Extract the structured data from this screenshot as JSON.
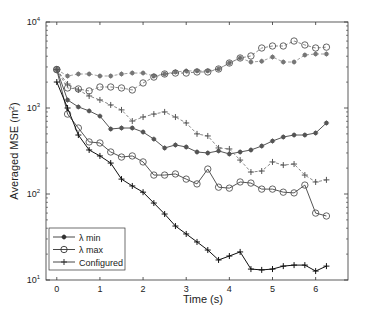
{
  "chart_data": {
    "type": "line",
    "title": "",
    "xlabel": "Time (s)",
    "ylabel": "Averaged MSE (m²)",
    "ylabel_base": "Averaged MSE (m",
    "ylabel_sup": "2",
    "ylabel_tail": ")",
    "yscale": "log",
    "xlim": [
      -0.25,
      6.75
    ],
    "ylim": [
      10,
      10000
    ],
    "xticks": [
      0,
      1,
      2,
      3,
      4,
      5,
      6
    ],
    "xtick_labels": [
      "0",
      "1",
      "2",
      "3",
      "4",
      "5",
      "6"
    ],
    "yticks": [
      10,
      100,
      1000,
      10000
    ],
    "ytick_labels": [
      {
        "base": "10",
        "exp": "1"
      },
      {
        "base": "10",
        "exp": "2"
      },
      {
        "base": "10",
        "exp": "3"
      },
      {
        "base": "10",
        "exp": "4"
      }
    ],
    "grid": false,
    "legend_position": "lower left",
    "x": [
      0,
      0.25,
      0.5,
      0.75,
      1.0,
      1.25,
      1.5,
      1.75,
      2.0,
      2.25,
      2.5,
      2.75,
      3.0,
      3.25,
      3.5,
      3.75,
      4.0,
      4.25,
      4.5,
      4.75,
      5.0,
      5.25,
      5.5,
      5.75,
      6.0,
      6.25
    ],
    "series": [
      {
        "name": "λ min",
        "legend": true,
        "style": "solid",
        "marker": "asterisk-dot",
        "color": "#555555",
        "values": [
          2800,
          1240,
          1030,
          925,
          805,
          570,
          585,
          585,
          525,
          435,
          343,
          372,
          352,
          308,
          300,
          317,
          292,
          308,
          325,
          361,
          413,
          460,
          485,
          485,
          512,
          670
        ]
      },
      {
        "name": "λ max",
        "legend": true,
        "style": "solid",
        "marker": "circle",
        "color": "#555555",
        "values": [
          2800,
          850,
          585,
          403,
          392,
          308,
          269,
          277,
          236,
          166,
          166,
          171,
          149,
          131,
          195,
          120,
          117,
          138,
          134,
          114,
          114,
          105,
          103,
          127,
          60,
          55.5
        ]
      },
      {
        "name": "Configured",
        "legend": true,
        "style": "solid",
        "marker": "plus",
        "color": "#111111",
        "values": [
          2005,
          1000,
          485,
          325,
          277,
          229,
          149,
          124,
          105,
          78.5,
          58.5,
          42.4,
          34.3,
          27.7,
          22.3,
          17.1,
          19.0,
          21.2,
          13.4,
          13.1,
          13.4,
          14.5,
          14.9,
          14.9,
          12.7,
          14.5
        ]
      },
      {
        "name": "λ min (dashed)",
        "legend": false,
        "style": "dashed",
        "marker": "asterisk-dot",
        "color": "#777777",
        "values": [
          2800,
          2355,
          2485,
          2485,
          2355,
          2355,
          2485,
          2550,
          2550,
          2355,
          2485,
          2625,
          2700,
          2700,
          2700,
          2840,
          3335,
          3815,
          3425,
          3500,
          3920,
          3425,
          3425,
          4130,
          4245,
          4245
        ]
      },
      {
        "name": "λ max (dashed)",
        "legend": false,
        "style": "dashed",
        "marker": "circle",
        "color": "#555555",
        "values": [
          2800,
          1710,
          1665,
          1580,
          1755,
          1755,
          1710,
          1620,
          1955,
          2290,
          2485,
          2550,
          2550,
          2625,
          2625,
          2840,
          3335,
          3815,
          4025,
          4985,
          5260,
          5260,
          6010,
          5405,
          4985,
          5100
        ]
      },
      {
        "name": "Configured (dashed)",
        "legend": false,
        "style": "dashed",
        "marker": "plus",
        "color": "#555555",
        "values": [
          2800,
          1900,
          1620,
          1380,
          1240,
          1085,
          950,
          705,
          785,
          850,
          900,
          785,
          670,
          500,
          473,
          343,
          334,
          248,
          180,
          185,
          236,
          217,
          223,
          166,
          138,
          146
        ]
      }
    ]
  },
  "legend": {
    "items": [
      {
        "label": "λ min",
        "marker": "asterisk-dot"
      },
      {
        "label": "λ max",
        "marker": "circle"
      },
      {
        "label": "Configured",
        "marker": "plus"
      }
    ]
  }
}
